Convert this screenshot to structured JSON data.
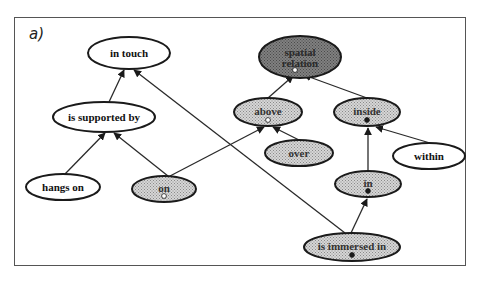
{
  "figure": {
    "panel_label": "a)",
    "background": "#ffffff",
    "frame_color": "#555555"
  },
  "colors": {
    "white_fill": "#ffffff",
    "stipple_fill": "#c8c8c8",
    "dark_fill": "#7a7a7a",
    "stroke": "#1a1a1a",
    "edge": "#2a2a2a"
  },
  "nodes": [
    {
      "id": "in_touch",
      "label": "in touch",
      "cx": 129,
      "cy": 53,
      "rx": 41,
      "ry": 16,
      "style": "white",
      "marker": "none"
    },
    {
      "id": "spatial_relation",
      "label": "spatial relation",
      "lines": [
        "spatial",
        "relation"
      ],
      "cx": 300,
      "cy": 57,
      "rx": 41,
      "ry": 21,
      "style": "dark",
      "marker": "open"
    },
    {
      "id": "is_supported_by",
      "label": "is supported by",
      "cx": 104,
      "cy": 117,
      "rx": 51,
      "ry": 15,
      "style": "white",
      "marker": "none"
    },
    {
      "id": "above",
      "label": "above",
      "cx": 268,
      "cy": 112,
      "rx": 34,
      "ry": 14,
      "style": "stipple",
      "marker": "open"
    },
    {
      "id": "inside",
      "label": "inside",
      "cx": 367,
      "cy": 112,
      "rx": 33,
      "ry": 14,
      "style": "stipple",
      "marker": "filled"
    },
    {
      "id": "over",
      "label": "over",
      "cx": 299,
      "cy": 153,
      "rx": 34,
      "ry": 13,
      "style": "stipple",
      "marker": "none"
    },
    {
      "id": "within",
      "label": "within",
      "cx": 429,
      "cy": 156,
      "rx": 36,
      "ry": 13,
      "style": "white",
      "marker": "none"
    },
    {
      "id": "hangs_on",
      "label": "hangs on",
      "cx": 63,
      "cy": 187,
      "rx": 37,
      "ry": 13,
      "style": "white",
      "marker": "none"
    },
    {
      "id": "on",
      "label": "on",
      "cx": 164,
      "cy": 189,
      "rx": 32,
      "ry": 13,
      "style": "stipple",
      "marker": "open"
    },
    {
      "id": "in",
      "label": "in",
      "cx": 368,
      "cy": 184,
      "rx": 33,
      "ry": 13,
      "style": "stipple",
      "marker": "filled"
    },
    {
      "id": "is_immersed_in",
      "label": "is immersed in",
      "cx": 352,
      "cy": 247,
      "rx": 48,
      "ry": 14,
      "style": "stipple",
      "marker": "filled"
    }
  ],
  "edges": [
    {
      "from": "is_supported_by",
      "to": "in_touch",
      "x1": 109,
      "y1": 102,
      "x2": 124,
      "y2": 70
    },
    {
      "from": "is_immersed_in",
      "to": "in_touch",
      "x1": 345,
      "y1": 233,
      "x2": 134,
      "y2": 70
    },
    {
      "from": "above",
      "to": "spatial_relation",
      "x1": 268,
      "y1": 98,
      "x2": 293,
      "y2": 76
    },
    {
      "from": "inside",
      "to": "spatial_relation",
      "x1": 367,
      "y1": 98,
      "x2": 304,
      "y2": 75
    },
    {
      "from": "hangs_on",
      "to": "is_supported_by",
      "x1": 65,
      "y1": 174,
      "x2": 105,
      "y2": 133
    },
    {
      "from": "on",
      "to": "is_supported_by",
      "x1": 168,
      "y1": 176,
      "x2": 114,
      "y2": 133
    },
    {
      "from": "on",
      "to": "above",
      "x1": 170,
      "y1": 176,
      "x2": 264,
      "y2": 127
    },
    {
      "from": "over",
      "to": "above",
      "x1": 299,
      "y1": 140,
      "x2": 273,
      "y2": 127
    },
    {
      "from": "within",
      "to": "inside",
      "x1": 430,
      "y1": 143,
      "x2": 376,
      "y2": 127
    },
    {
      "from": "in",
      "to": "inside",
      "x1": 368,
      "y1": 171,
      "x2": 368,
      "y2": 128
    },
    {
      "from": "is_immersed_in",
      "to": "in",
      "x1": 351,
      "y1": 233,
      "x2": 367,
      "y2": 199
    }
  ]
}
